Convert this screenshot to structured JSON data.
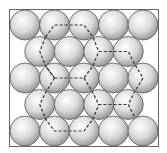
{
  "diagram": {
    "title": "",
    "rows": [
      {
        "row": 0,
        "count": 5,
        "offset": false
      },
      {
        "row": 1,
        "count": 4,
        "offset": true
      },
      {
        "row": 2,
        "count": 5,
        "offset": false
      },
      {
        "row": 3,
        "count": 4,
        "offset": true
      },
      {
        "row": 4,
        "count": 5,
        "offset": false
      }
    ],
    "sphere_color": "#d9d9d9",
    "sphere_highlight": "#ffffff",
    "sphere_outline": "#555555",
    "frame_color": "#666666",
    "dash_color": "#333333",
    "dashed_paths": [
      {
        "name": "path-top",
        "points": [
          [
            1.7,
            0.45
          ],
          [
            2,
            0
          ],
          [
            3,
            0
          ],
          [
            3.3,
            0.45
          ],
          [
            3.5,
            1
          ]
        ]
      },
      {
        "name": "path-left-upper",
        "points": [
          [
            1.7,
            0.45
          ],
          [
            1.5,
            1
          ],
          [
            1.7,
            1.55
          ],
          [
            2,
            2
          ]
        ]
      },
      {
        "name": "path-center",
        "points": [
          [
            2,
            2
          ],
          [
            3,
            2
          ],
          [
            3.3,
            1.55
          ],
          [
            3.5,
            1
          ]
        ]
      },
      {
        "name": "path-right-upper",
        "points": [
          [
            3.5,
            1
          ],
          [
            4.5,
            1
          ],
          [
            4.7,
            1.45
          ],
          [
            5,
            2
          ],
          [
            4.7,
            2.55
          ],
          [
            4.5,
            3
          ]
        ]
      },
      {
        "name": "path-center-down",
        "points": [
          [
            3,
            2
          ],
          [
            3.3,
            2.55
          ],
          [
            3.5,
            3
          ],
          [
            4.5,
            3
          ],
          [
            4.7,
            3.45
          ]
        ]
      },
      {
        "name": "path-left-lower",
        "points": [
          [
            2,
            2
          ],
          [
            1.7,
            2.55
          ],
          [
            1.5,
            3
          ],
          [
            1.7,
            3.55
          ],
          [
            2,
            4
          ],
          [
            3,
            4
          ],
          [
            3.3,
            3.55
          ],
          [
            3.5,
            3
          ]
        ]
      },
      {
        "name": "path-spoke-center",
        "points": [
          [
            2,
            2
          ],
          [
            1.7,
            1.55
          ]
        ]
      }
    ]
  }
}
